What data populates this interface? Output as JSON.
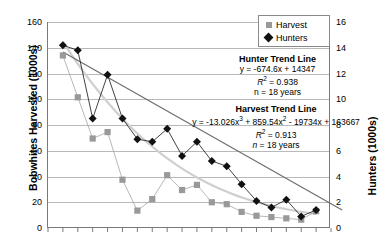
{
  "chart_data": {
    "type": "line",
    "title": "",
    "ylabel": "Bobwhites Harvested (1000s)",
    "ylabel_right": "Hunters (1000s)",
    "xlabel": "",
    "ylim": [
      0,
      160
    ],
    "ylim_right": [
      0,
      16
    ],
    "ytick_labels": [
      "160",
      "140",
      "120",
      "100",
      "80",
      "60",
      "40",
      "20",
      "0"
    ],
    "ytick_values": [
      160,
      140,
      120,
      100,
      80,
      60,
      40,
      20,
      0
    ],
    "ytick_right_labels": [
      "16",
      "14",
      "12",
      "10",
      "8",
      "6",
      "4",
      "2",
      "0"
    ],
    "ytick_right_values": [
      16,
      14,
      12,
      10,
      8,
      6,
      4,
      2,
      0
    ],
    "grid": true,
    "legend_position": "top-right",
    "x": [
      1,
      2,
      3,
      4,
      5,
      6,
      7,
      8,
      9,
      10,
      11,
      12,
      13,
      14,
      15,
      16,
      17,
      18
    ],
    "series": [
      {
        "name": "Harvest",
        "marker": "square",
        "color": "#999999",
        "axis": "left",
        "values": [
          134.0,
          101.5,
          69.5,
          74.5,
          37.5,
          13.5,
          22.5,
          41.0,
          29.5,
          33.5,
          20.0,
          18.5,
          12.5,
          9.5,
          8.5,
          7.5,
          6.5,
          13.0
        ]
      },
      {
        "name": "Hunters",
        "marker": "diamond",
        "color": "#111111",
        "axis": "right",
        "values": [
          14.2,
          13.8,
          8.5,
          11.9,
          8.5,
          6.9,
          6.7,
          7.7,
          5.6,
          6.7,
          5.2,
          4.8,
          3.4,
          2.1,
          1.6,
          2.2,
          0.9,
          1.4
        ]
      }
    ],
    "trendlines": [
      {
        "name": "Hunter Trend Line",
        "equation": "y = -674.6x + 14347",
        "r2_label": "R",
        "r2_value": "= 0.938",
        "n": "n = 18 years",
        "color": "#6b6b6b"
      },
      {
        "name": "Harvest Trend Line",
        "equation_pre": "y = -13.026x",
        "equation_mid": " + 859.54x",
        "equation_post": " - 19734x + 163667",
        "r2_label": "R",
        "r2_value": "= 0.913",
        "n": "n = 18 years",
        "color": "#cfcfcf"
      }
    ],
    "legend": [
      {
        "label": "Harvest",
        "marker": "square"
      },
      {
        "label": "Hunters",
        "marker": "diamond"
      }
    ]
  }
}
